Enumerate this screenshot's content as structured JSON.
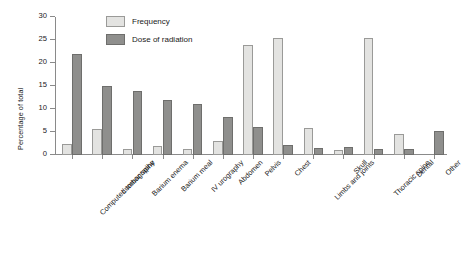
{
  "chart_data": {
    "type": "bar",
    "title": "",
    "xlabel": "",
    "ylabel": "Percentage of total",
    "ylim": [
      0,
      30
    ],
    "yticks": [
      0,
      5,
      10,
      15,
      20,
      25,
      30
    ],
    "grid": false,
    "legend_position": "top-center",
    "categories": [
      "Computed tomography",
      "Lumbar spine",
      "Barium enema",
      "Barium meal",
      "IV urography",
      "Abdomen",
      "Pelvis",
      "Chest",
      "Limbs and joints",
      "Skull",
      "Thoracic spine",
      "Dental",
      "Other"
    ],
    "series": [
      {
        "name": "Frequency",
        "color": "#e3e3e1",
        "values": [
          2.5,
          5.7,
          1.2,
          2.0,
          1.2,
          3.0,
          24.0,
          25.5,
          5.8,
          1.0,
          25.5,
          4.5,
          0.0
        ]
      },
      {
        "name": "Dose of radiation",
        "color": "#8f8f8d",
        "values": [
          22.0,
          15.0,
          14.0,
          12.0,
          11.0,
          8.3,
          6.0,
          2.2,
          1.5,
          1.8,
          1.4,
          1.3,
          5.2
        ]
      }
    ]
  },
  "legend": {
    "items": [
      {
        "label": "Frequency"
      },
      {
        "label": "Dose of radiation"
      }
    ]
  },
  "axes": {
    "y_title": "Percentage of total"
  }
}
